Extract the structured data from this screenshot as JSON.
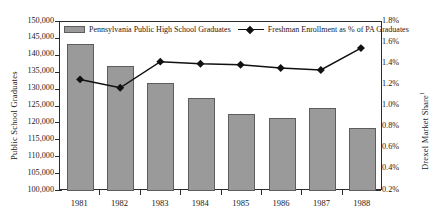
{
  "chart_data": {
    "type": "bar",
    "title": "",
    "categories": [
      "1981",
      "1982",
      "1983",
      "1984",
      "1985",
      "1986",
      "1987",
      "1988"
    ],
    "xlabel": "",
    "ylabel": "Public School Graduates",
    "y2label": "Drexel Market Share",
    "y2label_superscript": "1",
    "ylim": [
      100000,
      150000
    ],
    "y2lim": [
      0.2,
      1.8
    ],
    "yticks": [
      "100,000",
      "105,000",
      "110,000",
      "115,000",
      "120,000",
      "125,000",
      "130,000",
      "135,000",
      "140,000",
      "145,000",
      "150,000"
    ],
    "ytick_values": [
      100000,
      105000,
      110000,
      115000,
      120000,
      125000,
      130000,
      135000,
      140000,
      145000,
      150000
    ],
    "y2ticks": [
      "0.2%",
      "0.4%",
      "0.6%",
      "0.8%",
      "1.0%",
      "1.2%",
      "1.4%",
      "1.6%",
      "1.8%"
    ],
    "y2tick_values": [
      0.2,
      0.4,
      0.6,
      0.8,
      1.0,
      1.2,
      1.4,
      1.6,
      1.8
    ],
    "grid": false,
    "legend_position": "top-inside",
    "series": [
      {
        "name": "Pennsylvania Public High School Graduates",
        "type": "bar",
        "axis": "left",
        "color": "#9a9a9a",
        "edge_color": "#5d5d5d",
        "values": [
          143500,
          137100,
          131900,
          127400,
          122800,
          121700,
          124500,
          118600
        ]
      },
      {
        "name": "Freshman Enrollment as % of PA Graduates",
        "type": "line",
        "axis": "right",
        "color": "#111111",
        "marker": "diamond",
        "values": [
          1.25,
          1.17,
          1.42,
          1.4,
          1.39,
          1.36,
          1.34,
          1.55
        ]
      }
    ]
  },
  "legend": {
    "items": [
      {
        "label": "Pennsylvania Public High School Graduates",
        "marker": "bar-swatch"
      },
      {
        "label": "Freshman Enrollment as % of PA Graduates",
        "marker": "line-diamond-swatch"
      }
    ]
  },
  "colors": {
    "bar_fill": "#9a9a9a",
    "bar_edge": "#5d5d5d",
    "line": "#111111",
    "axis": "#2b2b2b",
    "background": "#ffffff"
  }
}
